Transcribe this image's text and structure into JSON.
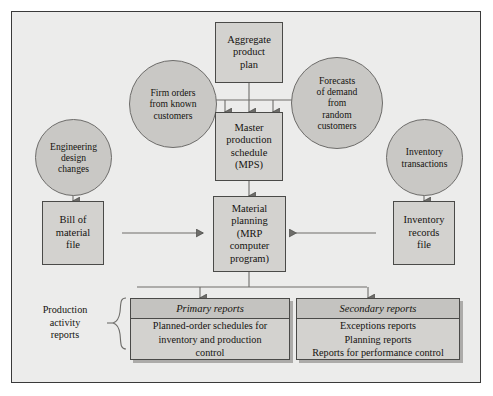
{
  "diagram": {
    "colors": {
      "page_background": "#ffffff",
      "panel_background": "#ececeb",
      "box_fill": "#d3d2cf",
      "circle_fill": "#c9c8c5",
      "report_header_fill": "#c4c3c0",
      "stroke": "#4a4a48",
      "text": "#15130f"
    },
    "inputs": {
      "aggregate_plan": "Aggregate\nproduct\nplan",
      "firm_orders": "Firm orders\nfrom known\ncustomers",
      "forecasts": "Forecasts\nof demand\nfrom\nrandom\ncustomers",
      "engineering_changes": "Engineering\ndesign\nchanges",
      "inventory_transactions": "Inventory\ntransactions"
    },
    "processes": {
      "master_schedule": "Master\nproduction\nschedule\n(MPS)",
      "material_planning": "Material\nplanning\n(MRP\ncomputer\nprogram)"
    },
    "files": {
      "bill_of_material": "Bill of\nmaterial\nfile",
      "inventory_records": "Inventory\nrecords\nfile"
    },
    "outputs": {
      "side_label": "Production\nactivity\nreports",
      "primary": {
        "header": "Primary reports",
        "body": "Planned-order schedules for\ninventory and production\ncontrol"
      },
      "secondary": {
        "header": "Secondary reports",
        "body": "Exceptions reports\nPlanning reports\nReports for performance control"
      }
    }
  }
}
